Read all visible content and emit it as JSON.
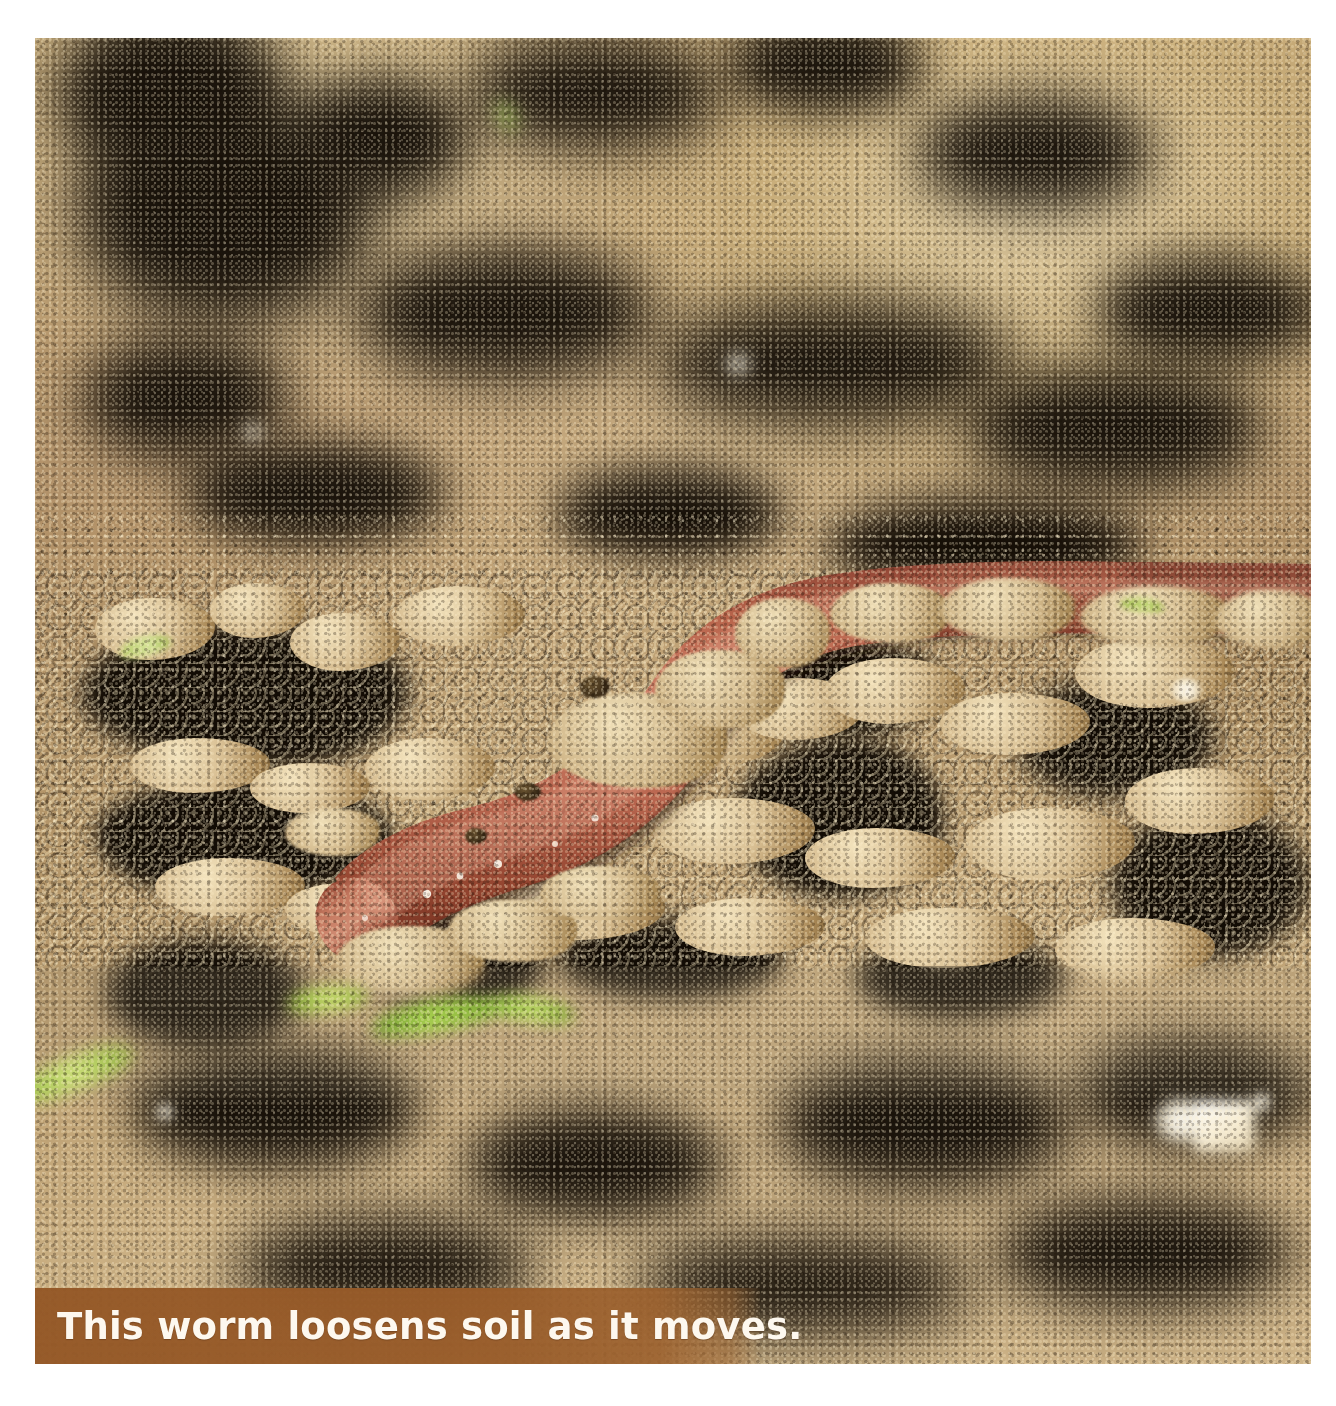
{
  "page": {
    "background_color": "#ffffff",
    "width": 1336,
    "height": 1406
  },
  "photo": {
    "subject": "earthworm crawling on loose soil",
    "description": "Close-up photograph of a reddish-brown earthworm with visible body segments moving across crumbly tan soil with dark crevices and small green sprouts.",
    "frame": {
      "left": 35,
      "top": 38,
      "width": 1276,
      "height": 1326
    },
    "colors": {
      "soil_light": "#d8c08f",
      "soil_mid": "#b4936a",
      "soil_dark": "#120c05",
      "worm_body": "#b4654a",
      "worm_highlight": "#d89078",
      "worm_shadow": "#7a3526",
      "sprout_green": "#8cbf3f",
      "page_white": "#ffffff"
    }
  },
  "caption": {
    "text": "This worm loosens soil as it moves.",
    "background_color": "#945827",
    "text_color": "#fdf8ef",
    "bar": {
      "left": 35,
      "top": 1288,
      "width": 725,
      "height": 76
    }
  }
}
